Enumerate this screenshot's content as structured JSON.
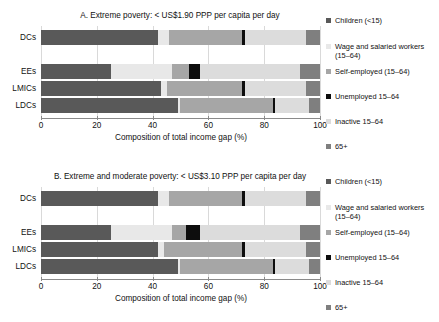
{
  "figure": {
    "axis_title": "Composition of total income gap (%)",
    "categories": [
      "DCs",
      "EEs",
      "LMICs",
      "LDCs"
    ],
    "x_ticks": [
      0,
      20,
      40,
      60,
      80,
      100
    ],
    "xlim": [
      0,
      100
    ],
    "series_names": [
      "Children (<15)",
      "Wage and salaried workers (15–64)",
      "Self-employed (15–64)",
      "Unemployed 15–64",
      "Inactive 15–64",
      "65+"
    ],
    "colors": [
      "#595959",
      "#e8e8e8",
      "#a6a6a6",
      "#0d0d0d",
      "#dcdcdc",
      "#7f7f7f"
    ]
  },
  "legend": {
    "items": [
      {
        "label": "Children (<15)",
        "color": "#595959",
        "top": 0
      },
      {
        "label": "Wage and salaried workers (15–64)",
        "color": "#e8e8e8",
        "top": 26
      },
      {
        "label": "Self-employed (15–64)",
        "color": "#a6a6a6",
        "top": 51
      },
      {
        "label": "Unemployed 15–64",
        "color": "#0d0d0d",
        "top": 76
      },
      {
        "label": "Inactive 15–64",
        "color": "#dcdcdc",
        "top": 101
      },
      {
        "label": "65+",
        "color": "#7f7f7f",
        "top": 126
      }
    ]
  },
  "chart_data": [
    {
      "id": "panel-a",
      "type": "bar",
      "orientation": "horizontal",
      "stacked": true,
      "title": "A. Extreme poverty: < US$1.90 PPP per capita per day",
      "xlabel": "Composition of total income gap (%)",
      "ylabel": "",
      "xlim": [
        0,
        100
      ],
      "xticks": [
        0,
        20,
        40,
        60,
        80,
        100
      ],
      "grid": true,
      "legend_position": "right",
      "categories": [
        "DCs",
        "EEs",
        "LMICs",
        "LDCs"
      ],
      "series": [
        {
          "name": "Children (<15)",
          "values": [
            42.0,
            25.0,
            43.0,
            49.0
          ]
        },
        {
          "name": "Wage and salaried workers (15–64)",
          "values": [
            4.0,
            22.0,
            2.0,
            1.0
          ]
        },
        {
          "name": "Self-employed (15–64)",
          "values": [
            26.0,
            6.0,
            27.0,
            33.0
          ]
        },
        {
          "name": "Unemployed 15–64",
          "values": [
            1.0,
            4.0,
            1.0,
            1.0
          ]
        },
        {
          "name": "Inactive 15–64",
          "values": [
            22.0,
            36.0,
            22.0,
            12.0
          ]
        },
        {
          "name": "65+",
          "values": [
            5.0,
            7.0,
            5.0,
            4.0
          ]
        }
      ]
    },
    {
      "id": "panel-b",
      "type": "bar",
      "orientation": "horizontal",
      "stacked": true,
      "title": "B. Extreme and moderate poverty: < US$3.10 PPP per capita per day",
      "xlabel": "Composition of total income gap (%)",
      "ylabel": "",
      "xlim": [
        0,
        100
      ],
      "xticks": [
        0,
        20,
        40,
        60,
        80,
        100
      ],
      "grid": true,
      "legend_position": "right",
      "categories": [
        "DCs",
        "EEs",
        "LMICs",
        "LDCs"
      ],
      "series": [
        {
          "name": "Children (<15)",
          "values": [
            42.0,
            25.0,
            42.0,
            49.0
          ]
        },
        {
          "name": "Wage and salaried workers (15–64)",
          "values": [
            4.0,
            22.0,
            2.0,
            1.0
          ]
        },
        {
          "name": "Self-employed (15–64)",
          "values": [
            26.0,
            5.0,
            28.0,
            33.0
          ]
        },
        {
          "name": "Unemployed 15–64",
          "values": [
            1.0,
            5.0,
            1.0,
            1.0
          ]
        },
        {
          "name": "Inactive 15–64",
          "values": [
            22.0,
            36.0,
            22.0,
            12.0
          ]
        },
        {
          "name": "65+",
          "values": [
            5.0,
            7.0,
            5.0,
            4.0
          ]
        }
      ]
    }
  ]
}
